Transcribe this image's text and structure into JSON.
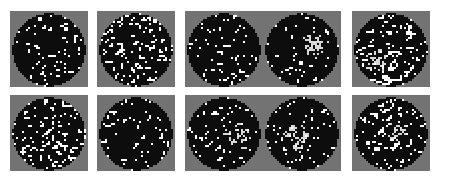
{
  "figure": {
    "caption": "",
    "canvas": {
      "width": 451,
      "height": 184
    },
    "background_color": "#ffffff",
    "panel_background_color": "#737373",
    "cell_colors": {
      "empty": "#0d0d0d",
      "occupied": "#ffffff",
      "cluster": "#d9d9d9",
      "outside": "#737373"
    },
    "grid": {
      "rows": 2,
      "cols": 5,
      "total_panels": 10
    },
    "panel_geometry": {
      "width": 78,
      "height": 76,
      "col_x": [
        10,
        97,
        185,
        263,
        352
      ],
      "row_y": [
        11,
        95
      ],
      "cell_size": 2,
      "cells_across": 39,
      "circle_radius_cells": 18.2
    }
  },
  "chart_data": {
    "type": "heatmap",
    "title": "",
    "xlabel": "",
    "ylabel": "",
    "panels": [
      {
        "index": 1,
        "row": 1,
        "col": 1,
        "label": "",
        "seed": 10117,
        "density": 0.27,
        "cluster": {
          "present": false,
          "cx": 0.0,
          "cy": 0.0,
          "r": 0.0,
          "strength": 0.0
        },
        "streak_strength": 0.55
      },
      {
        "index": 2,
        "row": 1,
        "col": 2,
        "label": "",
        "seed": 20231,
        "density": 0.3,
        "cluster": {
          "present": false,
          "cx": 0.0,
          "cy": 0.0,
          "r": 0.0,
          "strength": 0.0
        },
        "streak_strength": 0.45
      },
      {
        "index": 3,
        "row": 1,
        "col": 3,
        "label": "",
        "seed": 30449,
        "density": 0.22,
        "cluster": {
          "present": false,
          "cx": 0.0,
          "cy": 0.0,
          "r": 0.0,
          "strength": 0.0
        },
        "streak_strength": 0.4
      },
      {
        "index": 4,
        "row": 1,
        "col": 4,
        "label": "",
        "seed": 40693,
        "density": 0.24,
        "cluster": {
          "present": true,
          "cx": 0.34,
          "cy": -0.12,
          "r": 0.42,
          "strength": 0.88
        },
        "streak_strength": 0.5
      },
      {
        "index": 5,
        "row": 1,
        "col": 5,
        "label": "",
        "seed": 50873,
        "density": 0.31,
        "cluster": {
          "present": true,
          "cx": -0.38,
          "cy": 0.3,
          "r": 0.38,
          "strength": 0.62
        },
        "streak_strength": 0.52
      },
      {
        "index": 6,
        "row": 2,
        "col": 1,
        "label": "",
        "seed": 60139,
        "density": 0.3,
        "cluster": {
          "present": false,
          "cx": 0.0,
          "cy": 0.0,
          "r": 0.0,
          "strength": 0.0
        },
        "streak_strength": 0.46
      },
      {
        "index": 7,
        "row": 2,
        "col": 2,
        "label": "",
        "seed": 70313,
        "density": 0.21,
        "cluster": {
          "present": false,
          "cx": 0.0,
          "cy": 0.0,
          "r": 0.0,
          "strength": 0.0
        },
        "streak_strength": 0.42
      },
      {
        "index": 8,
        "row": 2,
        "col": 3,
        "label": "",
        "seed": 80557,
        "density": 0.27,
        "cluster": {
          "present": true,
          "cx": 0.4,
          "cy": 0.05,
          "r": 0.44,
          "strength": 0.55
        },
        "streak_strength": 0.7
      },
      {
        "index": 9,
        "row": 2,
        "col": 4,
        "label": "",
        "seed": 90787,
        "density": 0.23,
        "cluster": {
          "present": true,
          "cx": -0.18,
          "cy": 0.1,
          "r": 0.46,
          "strength": 0.58
        },
        "streak_strength": 0.78
      },
      {
        "index": 10,
        "row": 2,
        "col": 5,
        "label": "",
        "seed": 11093,
        "density": 0.29,
        "cluster": {
          "present": true,
          "cx": 0.2,
          "cy": -0.05,
          "r": 0.34,
          "strength": 0.66
        },
        "streak_strength": 0.6
      }
    ]
  }
}
